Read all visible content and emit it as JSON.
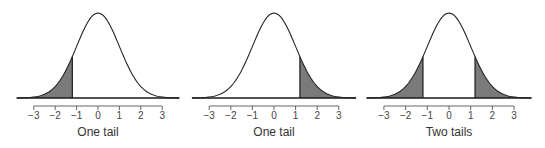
{
  "chart_data": [
    {
      "type": "area",
      "title": "",
      "caption": "One tail",
      "distribution": "standard normal",
      "shaded_region": "left tail",
      "cutoffs": [
        -1.2
      ],
      "xlabel": "One tail",
      "ylabel": "",
      "x_ticks": [
        -3,
        -2,
        -1,
        0,
        1,
        2,
        3
      ],
      "x_tick_labels": [
        "−3",
        "−2",
        "−1",
        "0",
        "1",
        "2",
        "3"
      ],
      "xlim": [
        -3.8,
        3.8
      ],
      "grid": false,
      "legend": "none"
    },
    {
      "type": "area",
      "title": "",
      "caption": "One tail",
      "distribution": "standard normal",
      "shaded_region": "right tail",
      "cutoffs": [
        1.2
      ],
      "xlabel": "One tail",
      "ylabel": "",
      "x_ticks": [
        -3,
        -2,
        -1,
        0,
        1,
        2,
        3
      ],
      "x_tick_labels": [
        "−3",
        "−2",
        "−1",
        "0",
        "1",
        "2",
        "3"
      ],
      "xlim": [
        -3.8,
        3.8
      ],
      "grid": false,
      "legend": "none"
    },
    {
      "type": "area",
      "title": "",
      "caption": "Two tails",
      "distribution": "standard normal",
      "shaded_region": "both tails",
      "cutoffs": [
        -1.2,
        1.2
      ],
      "xlabel": "Two tails",
      "ylabel": "",
      "x_ticks": [
        -3,
        -2,
        -1,
        0,
        1,
        2,
        3
      ],
      "x_tick_labels": [
        "−3",
        "−2",
        "−1",
        "0",
        "1",
        "2",
        "3"
      ],
      "xlim": [
        -3.8,
        3.8
      ],
      "grid": false,
      "legend": "none"
    }
  ],
  "panels": [
    {
      "caption": "One tail",
      "shade": "left",
      "cutoff": 1.2,
      "origin_x": 98,
      "unit_px": 21.4
    },
    {
      "caption": "One tail",
      "shade": "right",
      "cutoff": 1.2,
      "origin_x": 274,
      "unit_px": 21.6
    },
    {
      "caption": "Two tails",
      "shade": "both",
      "cutoff": 1.2,
      "origin_x": 449,
      "unit_px": 21.7
    }
  ],
  "layout": {
    "baseline_y": 98,
    "peak_y": 13,
    "curve_extent": 3.8,
    "tick_axis_y": 106,
    "tick_len": 4,
    "tick_label_y": 119,
    "caption_y": 136
  },
  "colors": {
    "shade": "#7a7a7a",
    "curve": "#222222",
    "axis": "#555555",
    "text": "#333333"
  }
}
